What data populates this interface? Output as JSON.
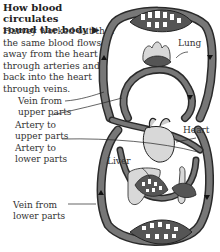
{
  "title_line1": "How blood circulates",
  "title_line2": "round the body ▶",
  "description": "Harvey worked out that the same blood flows away from the heart through arteries and back into the heart through veins.",
  "labels": {
    "lung": "Lung",
    "heart": "Heart",
    "liver": "Liver",
    "vein_upper_1": "Vein from",
    "vein_upper_2": "upper parts",
    "artery_upper_1": "Artery to",
    "artery_upper_2": "upper parts",
    "artery_lower_1": "Artery to",
    "artery_lower_2": "lower parts",
    "vein_lower_1": "Vein from",
    "vein_lower_2": "lower parts"
  },
  "colors": {
    "vessel": "#6b6b6b",
    "vessel_outline": "#2a2a2a",
    "organ_fill": "#d8d8d8",
    "text": "#333333"
  }
}
